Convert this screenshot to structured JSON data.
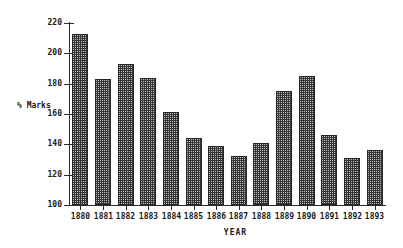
{
  "chart_data": {
    "type": "bar",
    "title": "",
    "xlabel": "YEAR",
    "ylabel": "% Marks",
    "categories": [
      "1880",
      "1881",
      "1882",
      "1883",
      "1884",
      "1885",
      "1886",
      "1887",
      "1888",
      "1889",
      "1890",
      "1891",
      "1892",
      "1893"
    ],
    "values": [
      213,
      183,
      193,
      184,
      161,
      144,
      139,
      132,
      141,
      175,
      185,
      146,
      131,
      136
    ],
    "ylim": [
      100,
      220
    ],
    "yticks": [
      100,
      120,
      140,
      160,
      180,
      200,
      220
    ],
    "ytick_labels": [
      "100",
      "120",
      "140",
      "160",
      "180",
      "200",
      "220"
    ],
    "grid": false,
    "legend": null,
    "series": [
      {
        "name": "% Marks",
        "values": [
          213,
          183,
          193,
          184,
          161,
          144,
          139,
          132,
          141,
          175,
          185,
          146,
          131,
          136
        ]
      }
    ]
  },
  "style": {
    "bar_fill": "#b9b9b9",
    "bar_edge": "#262626",
    "axis_color": "#2b2b2b",
    "text_color": "#1a1a1a",
    "background": "#ffffff"
  }
}
